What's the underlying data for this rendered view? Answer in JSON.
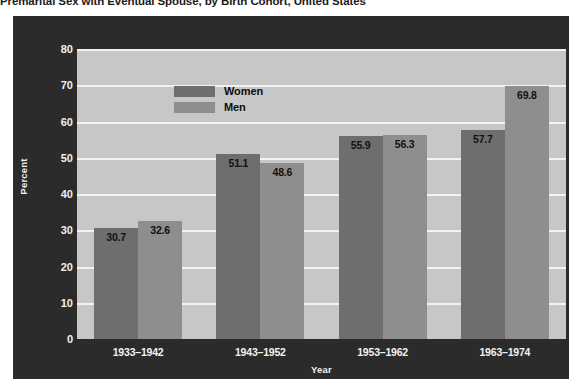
{
  "title": "Premarital Sex with Eventual Spouse, by Birth Cohort, United States",
  "legend": {
    "women_label": "Women",
    "men_label": "Men"
  },
  "axes": {
    "ylabel": "Percent",
    "xlabel": "Year"
  },
  "colors": {
    "women": "#6e6e6e",
    "men": "#8e8e8e",
    "frame": "#2b2b2b",
    "plot_background": "#c7c7c7",
    "gridline": "#f2f2f2"
  },
  "chart_data": {
    "type": "bar",
    "title": "Premarital Sex with Eventual Spouse, by Birth Cohort, United States",
    "xlabel": "Year",
    "ylabel": "Percent",
    "ylim": [
      0,
      80
    ],
    "yticks": [
      0,
      10,
      20,
      30,
      40,
      50,
      60,
      70,
      80
    ],
    "ytick_labels": [
      "0",
      "10",
      "20",
      "30",
      "40",
      "50",
      "60",
      "70",
      "80"
    ],
    "grid": true,
    "legend_position": "top-left-inside",
    "categories": [
      "1933–1942",
      "1943–1952",
      "1953–1962",
      "1963–1974"
    ],
    "series": [
      {
        "name": "Women",
        "color": "#6e6e6e",
        "values": [
          30.7,
          51.1,
          55.9,
          57.7
        ],
        "value_labels": [
          "30.7",
          "51.1",
          "55.9",
          "57.7"
        ]
      },
      {
        "name": "Men",
        "color": "#8e8e8e",
        "values": [
          32.6,
          48.6,
          56.3,
          69.8
        ],
        "value_labels": [
          "32.6",
          "48.6",
          "56.3",
          "69.8"
        ]
      }
    ]
  }
}
